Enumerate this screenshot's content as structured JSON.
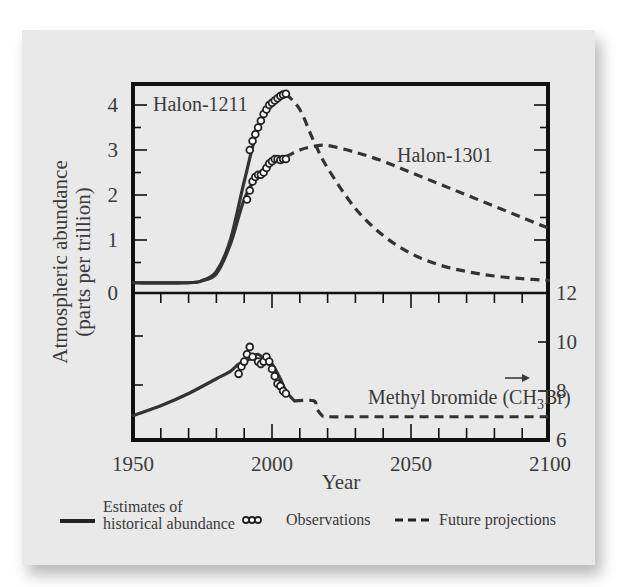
{
  "chart_data": [
    {
      "type": "line",
      "panel": "upper",
      "title": "",
      "xlabel": "Year",
      "ylabel": "Atmospheric abundance (parts per trillion)",
      "xlim": [
        1950,
        2100
      ],
      "ylim": [
        0,
        4.4
      ],
      "yticks": [
        0,
        1,
        2,
        3,
        4
      ],
      "grid": false,
      "series": [
        {
          "name": "Halon-1211",
          "historical": {
            "x": [
              1950,
              1970,
              1975,
              1980,
              1985,
              1990,
              1995,
              2000,
              2005
            ],
            "y": [
              0.05,
              0.05,
              0.1,
              0.3,
              1.0,
              2.3,
              3.5,
              4.0,
              4.25
            ]
          },
          "observations": {
            "x": [
              1992,
              1993,
              1994,
              1995,
              1996,
              1997,
              1998,
              1999,
              2000,
              2001,
              2002,
              2003,
              2004,
              2005
            ],
            "y": [
              3.0,
              3.2,
              3.35,
              3.5,
              3.65,
              3.8,
              3.9,
              4.0,
              4.05,
              4.1,
              4.15,
              4.2,
              4.23,
              4.25
            ]
          },
          "projection": {
            "x": [
              2005,
              2010,
              2015,
              2020,
              2030,
              2040,
              2050,
              2060,
              2070,
              2080,
              2090,
              2100
            ],
            "y": [
              4.25,
              3.9,
              3.2,
              2.6,
              1.7,
              1.1,
              0.7,
              0.45,
              0.3,
              0.2,
              0.14,
              0.1
            ]
          }
        },
        {
          "name": "Halon-1301",
          "historical": {
            "x": [
              1950,
              1970,
              1975,
              1980,
              1985,
              1990,
              1995,
              2000,
              2005
            ],
            "y": [
              0.05,
              0.05,
              0.1,
              0.25,
              0.9,
              1.9,
              2.45,
              2.7,
              2.85
            ]
          },
          "observations": {
            "x": [
              1991,
              1992,
              1993,
              1994,
              1995,
              1996,
              1997,
              1998,
              1999,
              2000,
              2001,
              2002,
              2003,
              2004,
              2005
            ],
            "y": [
              1.9,
              2.1,
              2.3,
              2.4,
              2.45,
              2.45,
              2.5,
              2.6,
              2.7,
              2.75,
              2.8,
              2.8,
              2.78,
              2.8,
              2.8
            ]
          },
          "projection": {
            "x": [
              2005,
              2010,
              2015,
              2020,
              2030,
              2040,
              2050,
              2060,
              2070,
              2080,
              2090,
              2100
            ],
            "y": [
              2.85,
              3.0,
              3.08,
              3.1,
              2.95,
              2.75,
              2.5,
              2.25,
              2.0,
              1.75,
              1.5,
              1.25
            ]
          }
        }
      ]
    },
    {
      "type": "line",
      "panel": "lower",
      "title": "",
      "xlabel": "Year",
      "ylabel": "Atmospheric abundance (parts per trillion)",
      "xlim": [
        1950,
        2100
      ],
      "ylim": [
        6,
        12
      ],
      "yticks": [
        6,
        8,
        10,
        12
      ],
      "y_axis_side": "right",
      "grid": false,
      "series": [
        {
          "name": "Methyl bromide (CH3Br)",
          "historical": {
            "x": [
              1950,
              1960,
              1970,
              1980,
              1985,
              1988,
              1992,
              1995,
              1998,
              2000,
              2003,
              2005,
              2008
            ],
            "y": [
              7.0,
              7.4,
              7.9,
              8.5,
              8.8,
              9.1,
              9.3,
              9.5,
              9.2,
              9.1,
              8.5,
              8.0,
              7.6
            ]
          },
          "observations": {
            "x": [
              1988,
              1989,
              1990,
              1991,
              1992,
              1993,
              1995,
              1996,
              1997,
              1998,
              1999,
              2000,
              2001,
              2002,
              2003,
              2004,
              2005
            ],
            "y": [
              8.7,
              9.0,
              9.2,
              9.5,
              9.8,
              9.4,
              9.2,
              9.1,
              9.2,
              9.4,
              9.2,
              8.9,
              8.6,
              8.3,
              8.2,
              8.0,
              7.9
            ]
          },
          "projection": {
            "x": [
              2008,
              2015,
              2016,
              2018,
              2020,
              2030,
              2040,
              2050,
              2060,
              2070,
              2080,
              2090,
              2100
            ],
            "y": [
              7.6,
              7.6,
              7.3,
              7.0,
              6.95,
              6.95,
              6.95,
              6.95,
              6.95,
              6.95,
              6.95,
              6.95,
              6.95
            ]
          }
        }
      ],
      "annotations": [
        {
          "type": "arrow",
          "direction": "right",
          "near": "Methyl bromide label"
        }
      ]
    }
  ],
  "axes": {
    "x_ticks": [
      "1950",
      "2000",
      "2050",
      "2100"
    ],
    "x_title": "Year",
    "y_title_line1": "Atmospheric abundance",
    "y_title_line2": "(parts per trillion)",
    "upper_y_ticks": [
      "0",
      "1",
      "2",
      "3",
      "4"
    ],
    "lower_y_ticks": [
      "12",
      "10",
      "8",
      "6"
    ]
  },
  "labels": {
    "halon1211": "Halon-1211",
    "halon1301": "Halon-1301",
    "methyl_prefix": "Methyl bromide (CH",
    "methyl_sub": "3",
    "methyl_suffix": "Br)"
  },
  "legend": {
    "historical_line1": "Estimates of",
    "historical_line2": "historical abundance",
    "observations": "Observations",
    "projections": "Future projections"
  },
  "colors": {
    "ink": "#3a3a3a",
    "frame": "#111111",
    "card": "#e9e9e9"
  }
}
